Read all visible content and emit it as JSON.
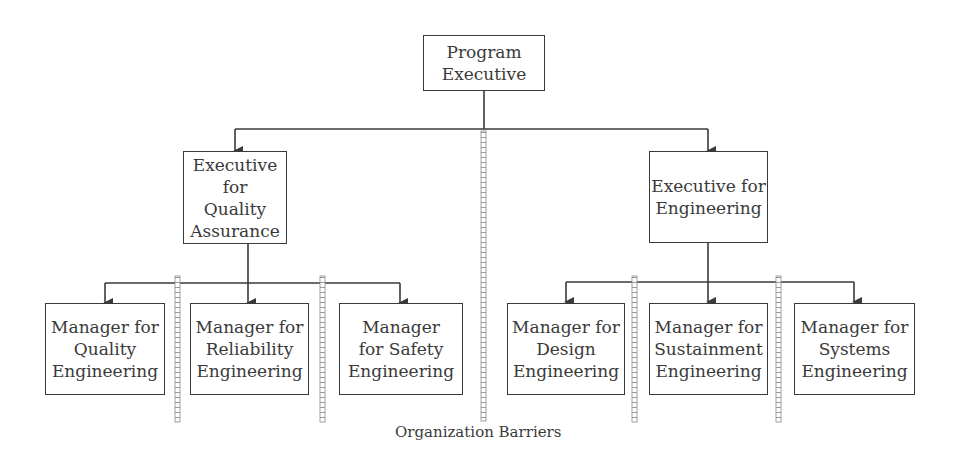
{
  "diagram": {
    "type": "org-chart",
    "root": {
      "label": "Program\nExecutive"
    },
    "executives": [
      {
        "label": "Executive for\nQuality\nAssurance"
      },
      {
        "label": "Executive for\nEngineering"
      }
    ],
    "managers": [
      {
        "label": "Manager for\nQuality\nEngineering",
        "reports_to": 0
      },
      {
        "label": "Manager for\nReliability\nEngineering",
        "reports_to": 0
      },
      {
        "label": "Manager\nfor Safety\nEngineering",
        "reports_to": 0
      },
      {
        "label": "Manager for\nDesign\nEngineering",
        "reports_to": 1
      },
      {
        "label": "Manager for\nSustainment\nEngineering",
        "reports_to": 1
      },
      {
        "label": "Manager for\nSystems\nEngineering",
        "reports_to": 1
      }
    ],
    "barriers_caption": "Organization Barriers",
    "colors": {
      "line": "#3a3a3a",
      "text": "#3a3a3a",
      "background": "#ffffff"
    }
  }
}
